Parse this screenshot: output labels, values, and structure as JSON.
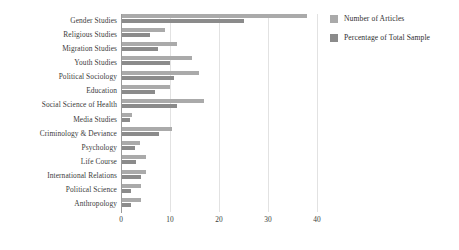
{
  "chart_data": {
    "type": "bar",
    "orientation": "horizontal",
    "title": "",
    "xlabel": "",
    "ylabel": "",
    "xlim": [
      0,
      40
    ],
    "xticks": [
      0,
      10,
      20,
      30,
      40
    ],
    "grid": true,
    "legend_position": "right",
    "categories": [
      "Gender Studies",
      "Religious Studies",
      "Migration Studies",
      "Youth Studies",
      "Political Sociology",
      "Education",
      "Social Science of Health",
      "Media Studies",
      "Criminology & Deviance",
      "Psychology",
      "Life Course",
      "International Relations",
      "Political Science",
      "Anthropology"
    ],
    "series": [
      {
        "name": "Number of Articles",
        "color": "#aaaaaa",
        "values": [
          38,
          9,
          11.5,
          14.5,
          16,
          10,
          17,
          2.3,
          10.5,
          3.8,
          5,
          5,
          4,
          4
        ]
      },
      {
        "name": "Percentage of Total Sample",
        "color": "#8b8b8b",
        "values": [
          25,
          6,
          7.5,
          10,
          10.8,
          7,
          11.5,
          1.8,
          7.8,
          2.9,
          3,
          4,
          2,
          2
        ]
      }
    ]
  },
  "legend": {
    "items": [
      {
        "label": "Number of Articles",
        "swatch": "articles"
      },
      {
        "label": "Percentage of Total Sample",
        "swatch": "percentage"
      }
    ]
  }
}
